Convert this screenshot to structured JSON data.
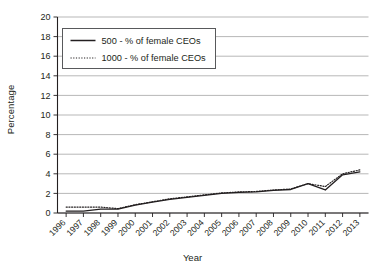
{
  "chart_data": {
    "type": "line",
    "title": "",
    "xlabel": "Year",
    "ylabel": "Percentage",
    "ylim": [
      0,
      20
    ],
    "ytick_step": 2,
    "yticks": [
      "0",
      "2",
      "4",
      "6",
      "8",
      "10",
      "12",
      "14",
      "16",
      "18",
      "20"
    ],
    "grid": true,
    "grid_axis": "y",
    "legend_position": "upper-left-inside",
    "categories": [
      "1996",
      "1997",
      "1998",
      "1999",
      "2000",
      "2001",
      "2002",
      "2003",
      "2004",
      "2005",
      "2006",
      "2007",
      "2008",
      "2009",
      "2010",
      "2011",
      "2012",
      "2013"
    ],
    "series": [
      {
        "name": "500 - % of female CEOs",
        "style": "solid",
        "color": "#231f20",
        "values": [
          0.2,
          0.2,
          0.4,
          0.4,
          0.8,
          1.1,
          1.4,
          1.6,
          1.8,
          2.0,
          2.1,
          2.15,
          2.3,
          2.4,
          3.0,
          2.35,
          3.9,
          4.2
        ]
      },
      {
        "name": "1000 - % of female CEOs",
        "style": "dotted",
        "color": "#231f20",
        "values": [
          0.6,
          0.6,
          0.6,
          0.45,
          0.85,
          1.15,
          1.45,
          1.65,
          1.85,
          2.05,
          2.15,
          2.2,
          2.35,
          2.45,
          3.0,
          2.7,
          4.0,
          4.4
        ]
      }
    ]
  },
  "legend": {
    "items": [
      {
        "label": "500 - % of female CEOs",
        "style": "solid"
      },
      {
        "label": "1000 - % of female CEOs",
        "style": "dotted"
      }
    ]
  },
  "axes": {
    "y_title": "Percentage",
    "x_title": "Year"
  }
}
